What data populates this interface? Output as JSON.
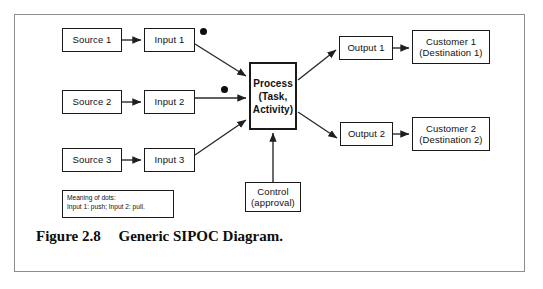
{
  "figure": {
    "caption_number": "Figure 2.8",
    "caption_title": "Generic SIPOC Diagram."
  },
  "nodes": {
    "source1": {
      "label": "Source 1"
    },
    "source2": {
      "label": "Source 2"
    },
    "source3": {
      "label": "Source 3"
    },
    "input1": {
      "label": "Input 1"
    },
    "input2": {
      "label": "Input 2"
    },
    "input3": {
      "label": "Input 3"
    },
    "process": {
      "line1": "Process",
      "line2": "(Task,",
      "line3": "Activity)"
    },
    "control": {
      "line1": "Control",
      "line2": "(approval)"
    },
    "output1": {
      "label": "Output 1"
    },
    "output2": {
      "label": "Output 2"
    },
    "customer1": {
      "line1": "Customer 1",
      "line2": "(Destination 1)"
    },
    "customer2": {
      "line1": "Customer 2",
      "line2": "(Destination 2)"
    }
  },
  "legend": {
    "line1": "Meaning of dots:",
    "line2": "Input 1: push; Input 2: pull."
  },
  "markers": {
    "dot1_name": "push-dot",
    "dot2_name": "pull-dot"
  },
  "colors": {
    "box_border": "#1a1a1a",
    "frame_border": "#8d8d8d",
    "connector": "#2b2b2b",
    "text": "#111111",
    "background": "#ffffff"
  }
}
